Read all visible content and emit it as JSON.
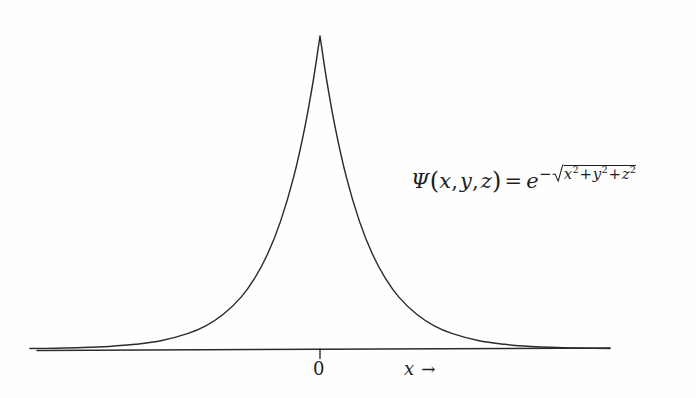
{
  "figure": {
    "background_color": "#fefefe",
    "ink_color": "#1e1e1e"
  },
  "formula": {
    "psi": "Ψ",
    "open_paren": "(",
    "var_x": "x",
    "comma1": ",",
    "var_y": "y",
    "comma2": ",",
    "var_z": "z",
    "close_paren": ")",
    "equals": "=",
    "base_e": "e",
    "minus": "−",
    "radicand_x": "x",
    "sup2_a": "2",
    "plus1": "+",
    "radicand_y": "y",
    "sup2_b": "2",
    "plus2": "+",
    "radicand_z": "z",
    "sup2_c": "2",
    "plain_text": "Ψ(x, y, z) = e^-√(x²+y²+z²)"
  },
  "axis": {
    "origin_tick_label": "0",
    "x_axis_label": "x",
    "x_axis_arrow": "→"
  },
  "chart_data": {
    "type": "line",
    "title": "",
    "subtitle": "",
    "xlabel": "x →",
    "ylabel": "",
    "legend": [],
    "legend_position": "none",
    "grid": false,
    "annotations": [
      {
        "text": "Ψ(x, y, z) = e^-√(x²+y²+z²)",
        "x_px": 411,
        "y_px": 190
      }
    ],
    "axis_ticks": [
      {
        "label": "0",
        "x_px": 320
      }
    ],
    "xlim": [
      -6.6,
      6.6
    ],
    "ylim": [
      0,
      1.0
    ],
    "function": "exp(-|x|)",
    "series": [
      {
        "name": "Psi(x,0,0) = e^(-|x|)",
        "color": "#1e1e1e",
        "x": [
          -6.6,
          -6.0,
          -5.4,
          -4.8,
          -4.2,
          -3.6,
          -3.0,
          -2.6,
          -2.2,
          -1.8,
          -1.5,
          -1.2,
          -0.9,
          -0.6,
          -0.35,
          -0.15,
          0.0,
          0.15,
          0.35,
          0.6,
          0.9,
          1.2,
          1.5,
          1.8,
          2.2,
          2.6,
          3.0,
          3.6,
          4.2,
          4.8,
          5.4,
          6.0,
          6.6
        ],
        "values": [
          0.0014,
          0.0025,
          0.0045,
          0.0082,
          0.015,
          0.027,
          0.05,
          0.074,
          0.111,
          0.165,
          0.223,
          0.301,
          0.407,
          0.549,
          0.705,
          0.861,
          1.0,
          0.861,
          0.705,
          0.549,
          0.407,
          0.301,
          0.223,
          0.165,
          0.111,
          0.074,
          0.05,
          0.027,
          0.015,
          0.0082,
          0.0045,
          0.0025,
          0.0014
        ]
      }
    ]
  }
}
